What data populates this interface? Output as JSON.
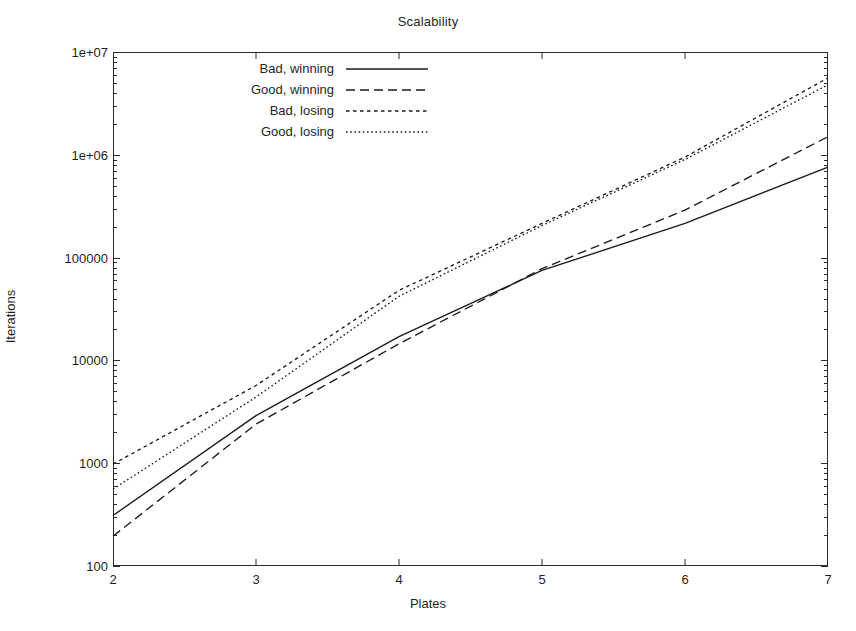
{
  "chart_data": {
    "type": "line",
    "title": "Scalability",
    "xlabel": "Plates",
    "ylabel": "Iterations",
    "xscale": "linear",
    "yscale": "log",
    "xlim": [
      2,
      7
    ],
    "ylim": [
      100,
      10000000
    ],
    "grid": false,
    "legend_position": "top-left-inside",
    "xticks": [
      "2",
      "3",
      "4",
      "5",
      "6",
      "7"
    ],
    "xtick_values": [
      2,
      3,
      4,
      5,
      6,
      7
    ],
    "yticks": [
      "100",
      "1000",
      "10000",
      "100000",
      "1e+06",
      "1e+07"
    ],
    "ytick_values": [
      100,
      1000,
      10000,
      100000,
      1000000,
      10000000
    ],
    "x": [
      2,
      3,
      4,
      5,
      6,
      7
    ],
    "series": [
      {
        "name": "Bad, winning",
        "style": "solid",
        "color": "#1a1a1a",
        "values": [
          310,
          2900,
          17000,
          75000,
          215000,
          760000
        ]
      },
      {
        "name": "Good, winning",
        "style": "dashed",
        "color": "#1a1a1a",
        "values": [
          195,
          2400,
          14500,
          78000,
          290000,
          1500000
        ]
      },
      {
        "name": "Bad, losing",
        "style": "dotted-medium",
        "color": "#1a1a1a",
        "values": [
          980,
          5700,
          48000,
          215000,
          950000,
          5600000
        ]
      },
      {
        "name": "Good, losing",
        "style": "dotted-fine",
        "color": "#1a1a1a",
        "values": [
          560,
          4400,
          42000,
          205000,
          900000,
          4800000
        ]
      }
    ]
  },
  "legend": {
    "items": [
      {
        "label": "Bad, winning",
        "style": "solid"
      },
      {
        "label": "Good, winning",
        "style": "dashed"
      },
      {
        "label": "Bad, losing",
        "style": "dotted-medium"
      },
      {
        "label": "Good, losing",
        "style": "dotted-fine"
      }
    ]
  },
  "colors": {
    "axis": "#2a2a2a",
    "text": "#1f1f1f",
    "series": "#1a1a1a",
    "background": "#ffffff"
  }
}
